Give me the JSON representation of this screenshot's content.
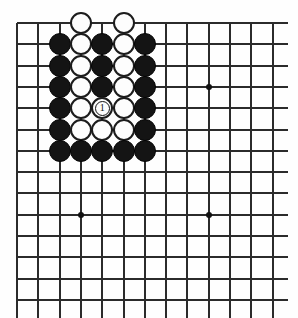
{
  "diagram": {
    "board": {
      "line_color": "#2b2b2b",
      "background_color": "#fefefe",
      "cols_visible": 13,
      "rows_visible": 14,
      "origin_x": 17,
      "origin_y": 23,
      "spacing": 21.3,
      "line_overrun_right": 15,
      "line_overrun_bottom": 18,
      "star_points": [
        {
          "col": 3,
          "row": 9,
          "name": "star-point-lower-left"
        },
        {
          "col": 9,
          "row": 3,
          "name": "star-point-upper-right"
        },
        {
          "col": 9,
          "row": 9,
          "name": "star-point-lower-right"
        }
      ]
    },
    "stone_radius": 11,
    "stones": [
      {
        "col": 3,
        "row": 0,
        "color": "white",
        "label": ""
      },
      {
        "col": 5,
        "row": 0,
        "color": "white",
        "label": ""
      },
      {
        "col": 2,
        "row": 1,
        "color": "black",
        "label": ""
      },
      {
        "col": 3,
        "row": 1,
        "color": "white",
        "label": ""
      },
      {
        "col": 4,
        "row": 1,
        "color": "black",
        "label": ""
      },
      {
        "col": 5,
        "row": 1,
        "color": "white",
        "label": ""
      },
      {
        "col": 6,
        "row": 1,
        "color": "black",
        "label": ""
      },
      {
        "col": 2,
        "row": 2,
        "color": "black",
        "label": ""
      },
      {
        "col": 3,
        "row": 2,
        "color": "white",
        "label": ""
      },
      {
        "col": 4,
        "row": 2,
        "color": "black",
        "label": ""
      },
      {
        "col": 5,
        "row": 2,
        "color": "white",
        "label": ""
      },
      {
        "col": 6,
        "row": 2,
        "color": "black",
        "label": ""
      },
      {
        "col": 2,
        "row": 3,
        "color": "black",
        "label": ""
      },
      {
        "col": 3,
        "row": 3,
        "color": "white",
        "label": ""
      },
      {
        "col": 4,
        "row": 3,
        "color": "black",
        "label": ""
      },
      {
        "col": 5,
        "row": 3,
        "color": "white",
        "label": ""
      },
      {
        "col": 6,
        "row": 3,
        "color": "black",
        "label": ""
      },
      {
        "col": 2,
        "row": 4,
        "color": "black",
        "label": ""
      },
      {
        "col": 3,
        "row": 4,
        "color": "white",
        "label": ""
      },
      {
        "col": 4,
        "row": 4,
        "color": "white",
        "label": "1"
      },
      {
        "col": 5,
        "row": 4,
        "color": "white",
        "label": ""
      },
      {
        "col": 6,
        "row": 4,
        "color": "black",
        "label": ""
      },
      {
        "col": 2,
        "row": 5,
        "color": "black",
        "label": ""
      },
      {
        "col": 3,
        "row": 5,
        "color": "white",
        "label": ""
      },
      {
        "col": 4,
        "row": 5,
        "color": "white",
        "label": ""
      },
      {
        "col": 5,
        "row": 5,
        "color": "white",
        "label": ""
      },
      {
        "col": 6,
        "row": 5,
        "color": "black",
        "label": ""
      },
      {
        "col": 2,
        "row": 6,
        "color": "black",
        "label": ""
      },
      {
        "col": 3,
        "row": 6,
        "color": "black",
        "label": ""
      },
      {
        "col": 4,
        "row": 6,
        "color": "black",
        "label": ""
      },
      {
        "col": 5,
        "row": 6,
        "color": "black",
        "label": ""
      },
      {
        "col": 6,
        "row": 6,
        "color": "black",
        "label": ""
      }
    ]
  }
}
